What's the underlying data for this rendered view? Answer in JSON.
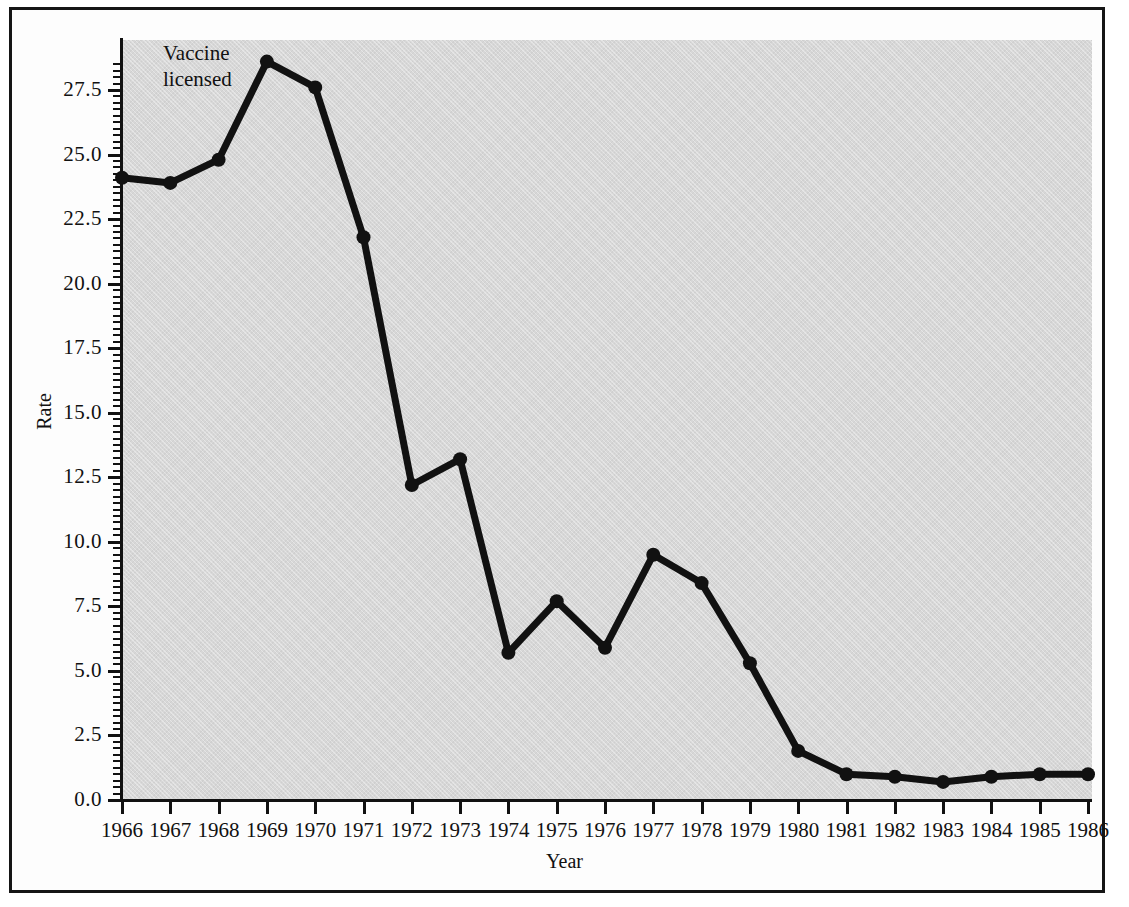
{
  "figure": {
    "annotation": "Vaccine\nlicensed",
    "frame_color": "#151515",
    "plot_background": "#d7d7d7",
    "line_color": "#111111"
  },
  "chart_data": {
    "type": "line",
    "title": "",
    "xlabel": "Year",
    "ylabel": "Rate",
    "xlim": [
      1966,
      1986
    ],
    "ylim": [
      0.0,
      29.0
    ],
    "grid": false,
    "legend": null,
    "annotations": [
      {
        "text": "Vaccine licensed",
        "near_x": 1969,
        "note": "label placed above the 1969 peak"
      }
    ],
    "x_tick_labels": [
      "1966",
      "1967",
      "1968",
      "1969",
      "1970",
      "1971",
      "1972",
      "1973",
      "1974",
      "1975",
      "1976",
      "1977",
      "1978",
      "1979",
      "1980",
      "1981",
      "1982",
      "1983",
      "1984",
      "1985",
      "1986"
    ],
    "y_tick_labels": [
      "0.0",
      "2.5",
      "5.0",
      "7.5",
      "10.0",
      "12.5",
      "15.0",
      "17.5",
      "20.0",
      "22.5",
      "25.0",
      "27.5"
    ],
    "y_ticks": [
      0.0,
      2.5,
      5.0,
      7.5,
      10.0,
      12.5,
      15.0,
      17.5,
      20.0,
      22.5,
      25.0,
      27.5
    ],
    "categories": [
      1966,
      1967,
      1968,
      1969,
      1970,
      1971,
      1972,
      1973,
      1974,
      1975,
      1976,
      1977,
      1978,
      1979,
      1980,
      1981,
      1982,
      1983,
      1984,
      1985,
      1986
    ],
    "values": [
      24.1,
      23.9,
      24.8,
      28.6,
      27.6,
      21.8,
      12.2,
      13.2,
      5.7,
      7.7,
      5.9,
      9.5,
      8.4,
      5.3,
      1.9,
      1.0,
      0.9,
      0.7,
      0.9,
      1.0,
      1.0
    ],
    "series": [
      {
        "name": "Rate",
        "marker": "filled-circle",
        "values": [
          24.1,
          23.9,
          24.8,
          28.6,
          27.6,
          21.8,
          12.2,
          13.2,
          5.7,
          7.7,
          5.9,
          9.5,
          8.4,
          5.3,
          1.9,
          1.0,
          0.9,
          0.7,
          0.9,
          1.0,
          1.0
        ]
      }
    ]
  }
}
